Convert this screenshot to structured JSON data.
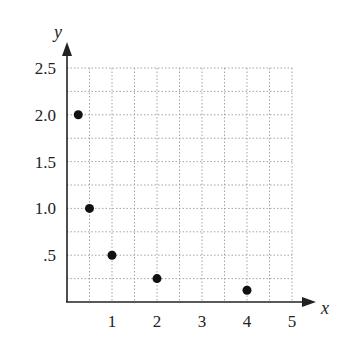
{
  "chart_data": {
    "type": "scatter",
    "title": "",
    "xlabel": "x",
    "ylabel": "y",
    "xlim": [
      0,
      5
    ],
    "ylim": [
      0,
      2.5
    ],
    "grid": true,
    "grid_step": {
      "x": 0.5,
      "y": 0.25
    },
    "x_ticks": [
      "1",
      "2",
      "3",
      "4",
      "5"
    ],
    "y_ticks": [
      ".5",
      "1.0",
      "1.5",
      "2.0",
      "2.5"
    ],
    "points": [
      {
        "x": 0.25,
        "y": 2.0
      },
      {
        "x": 0.5,
        "y": 1.0
      },
      {
        "x": 1,
        "y": 0.5
      },
      {
        "x": 2,
        "y": 0.25
      },
      {
        "x": 4,
        "y": 0.125
      }
    ],
    "legend": null
  }
}
